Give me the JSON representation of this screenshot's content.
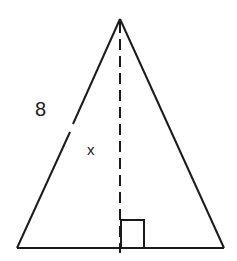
{
  "diagram": {
    "type": "isosceles-triangle-with-altitude",
    "side_label": "8",
    "altitude_label": "x",
    "right_angle_marker": true,
    "colors": {
      "stroke": "#1a1a1a",
      "background": "#ffffff"
    }
  }
}
